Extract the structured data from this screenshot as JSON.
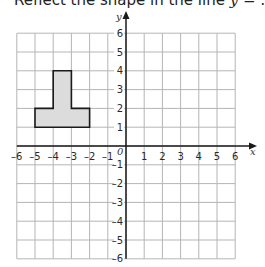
{
  "question": {
    "prefix": "Reflect the shape in the line ",
    "variable": "y",
    "suffix": " = …"
  },
  "chart_data": {
    "type": "coordinate-grid",
    "title": "Reflect the shape in the line y = …",
    "xlabel": "x",
    "ylabel": "y",
    "origin_label": "0",
    "xlim": [
      -6,
      6
    ],
    "ylim": [
      -6,
      6
    ],
    "x_ticks": [
      -6,
      -5,
      -4,
      -3,
      -2,
      -1,
      1,
      2,
      3,
      4,
      5,
      6
    ],
    "y_ticks": [
      -6,
      -5,
      -4,
      -3,
      -2,
      -1,
      1,
      2,
      3,
      4,
      5,
      6
    ],
    "grid": true,
    "shapes": [
      {
        "name": "T-shape",
        "fill": "#dcdcdc",
        "stroke": "#1a1a1a",
        "vertices": [
          [
            -5,
            1
          ],
          [
            -2,
            1
          ],
          [
            -2,
            2
          ],
          [
            -3,
            2
          ],
          [
            -3,
            4
          ],
          [
            -4,
            4
          ],
          [
            -4,
            2
          ],
          [
            -5,
            2
          ]
        ]
      }
    ]
  },
  "colors": {
    "grid": "#b5b5b5",
    "axis": "#1a1a1a",
    "shape_fill": "#dcdcdc",
    "shape_stroke": "#1a1a1a"
  }
}
